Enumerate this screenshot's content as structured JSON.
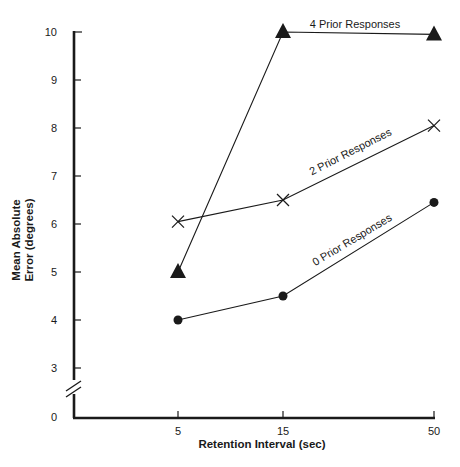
{
  "chart_data": {
    "type": "line",
    "title": "",
    "xlabel": "Retention Interval (sec)",
    "ylabel": [
      "Mean Absolute",
      "Error (degrees)"
    ],
    "x": [
      5,
      15,
      50
    ],
    "x_tick_labels": [
      "5",
      "15",
      "50"
    ],
    "y_tick_labels": [
      "0",
      "3",
      "4",
      "5",
      "6",
      "7",
      "8",
      "9",
      "10"
    ],
    "ylim": [
      0,
      10
    ],
    "y_axis_break": "between 0 and 3",
    "grid": false,
    "legend": "none (series labeled inline along lines)",
    "series": [
      {
        "name": "0 Prior Responses",
        "marker": "filled-circle",
        "values": [
          4.0,
          4.5,
          6.45
        ]
      },
      {
        "name": "2 Prior Responses",
        "marker": "x-cross",
        "values": [
          6.05,
          6.5,
          8.05
        ]
      },
      {
        "name": "4 Prior Responses",
        "marker": "filled-triangle",
        "values": [
          5.0,
          10.0,
          9.95
        ]
      }
    ]
  },
  "labels": {
    "series_0": "0 Prior Responses",
    "series_2": "2 Prior Responses",
    "series_4": "4 Prior Responses"
  },
  "colors": {
    "ink": "#1a1a1a",
    "background": "#ffffff"
  }
}
